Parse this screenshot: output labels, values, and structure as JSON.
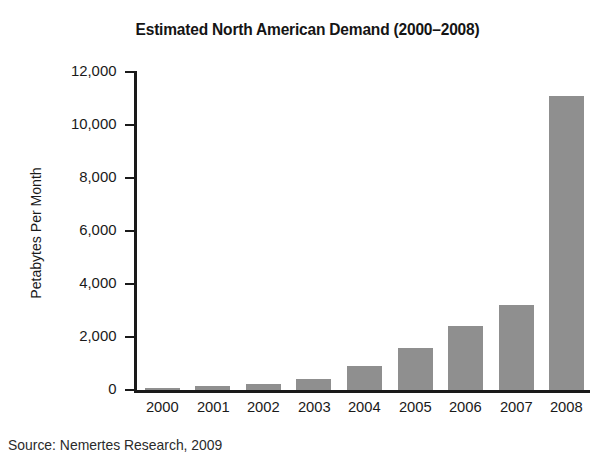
{
  "chart_data": {
    "type": "bar",
    "title": "Estimated North American Demand (2000–2008)",
    "xlabel": "",
    "ylabel": "Petabytes Per Month",
    "categories": [
      "2000",
      "2001",
      "2002",
      "2003",
      "2004",
      "2005",
      "2006",
      "2007",
      "2008"
    ],
    "values": [
      70,
      150,
      230,
      420,
      900,
      1600,
      2400,
      3200,
      11100
    ],
    "ylim": [
      0,
      12000
    ],
    "ytick_labels": [
      "12,000",
      "10,000",
      "8,000",
      "6,000",
      "4,000",
      "2,000",
      "0"
    ],
    "ytick_values": [
      12000,
      10000,
      8000,
      6000,
      4000,
      2000,
      0
    ],
    "grid": false,
    "legend": false,
    "bar_color": "#8f8f8f",
    "axis_color": "#1a1a1a",
    "source": "Source: Nemertes Research, 2009"
  }
}
